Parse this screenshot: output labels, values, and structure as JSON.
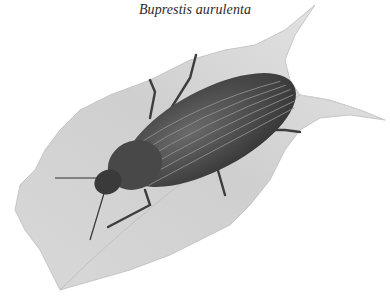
{
  "caption": {
    "text": "Buprestis aurulenta"
  },
  "illustration": {
    "subject": "beetle-on-leaf",
    "description": "Grayscale illustration of a jewel beetle resting diagonally on a pale gray leaf",
    "colors": {
      "background": "#ffffff",
      "leaf_light": "#e2e2e2",
      "leaf_mid": "#c9c9c9",
      "beetle_dark": "#3a3a3a",
      "beetle_mid": "#5a5a5a",
      "stripe": "#8a8a8a"
    }
  }
}
